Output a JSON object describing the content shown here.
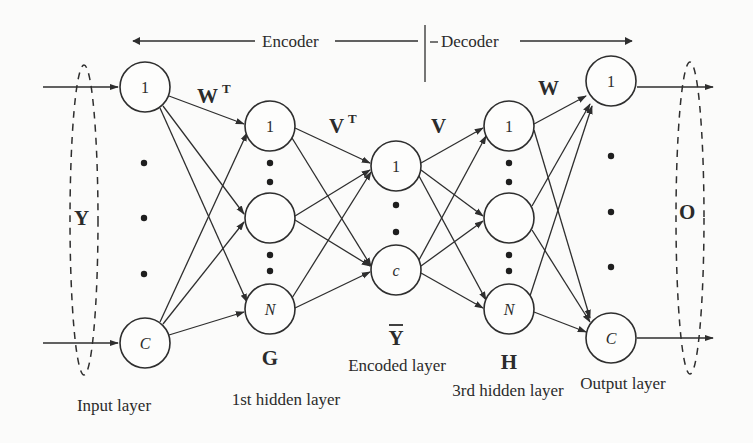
{
  "header": {
    "encoder_label": "Encoder",
    "decoder_label": "Decoder"
  },
  "layers": {
    "input": {
      "label": "Input layer",
      "group_symbol": "Y",
      "nodes": [
        "1",
        "C"
      ]
    },
    "hidden1": {
      "label": "1st hidden layer",
      "symbol": "G",
      "nodes": [
        "1",
        "",
        "N"
      ]
    },
    "encoded": {
      "label": "Encoded layer",
      "symbol": "Ȳ",
      "symbol_base": "Y",
      "nodes": [
        "1",
        "c"
      ]
    },
    "hidden3": {
      "label": "3rd hidden layer",
      "symbol": "H",
      "nodes": [
        "1",
        "",
        "N"
      ]
    },
    "output": {
      "label": "Output layer",
      "group_symbol": "O",
      "nodes": [
        "1",
        "C"
      ]
    }
  },
  "weights": {
    "w_transpose": {
      "base": "W",
      "sup": "T"
    },
    "v_transpose": {
      "base": "V",
      "sup": "T"
    },
    "v": {
      "base": "V"
    },
    "w": {
      "base": "W"
    }
  },
  "colors": {
    "ink": "#2e2e2e",
    "background": "#fbfbfa"
  }
}
